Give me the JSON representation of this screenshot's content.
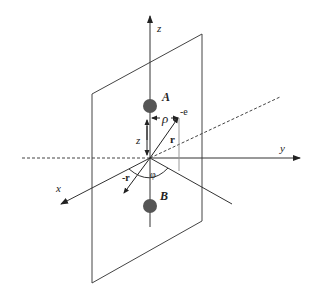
{
  "diagram": {
    "axes": {
      "x_label": "x",
      "y_label": "y",
      "z_label": "z"
    },
    "nuclei": [
      {
        "label": "A"
      },
      {
        "label": "B"
      }
    ],
    "electron": {
      "label": "-e"
    },
    "vectors": {
      "r_label": "r",
      "neg_r_label": "-r"
    },
    "distances": {
      "rho_label": "ρ",
      "z_label": "z"
    },
    "angle": {
      "phi_label": "φ"
    },
    "colors": {
      "line": "#333333",
      "nucleus": "#555555",
      "background": "#ffffff"
    }
  }
}
